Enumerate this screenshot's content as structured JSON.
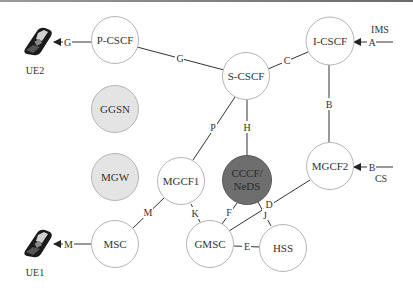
{
  "diagram": {
    "colors": {
      "line": "#333333",
      "node_stroke": "#b5b5b5",
      "node_fill": "#ffffff",
      "gray_fill": "#e4e4e4",
      "dark_fill": "#6e6e6e",
      "text": "#333333"
    },
    "nodes": {
      "pcscf": {
        "label": "P-CSCF"
      },
      "scscf": {
        "label": "S-CSCF"
      },
      "icscf": {
        "label": "I-CSCF"
      },
      "ggsn": {
        "label": "GGSN"
      },
      "mgw": {
        "label": "MGW"
      },
      "mgcf1": {
        "label": "MGCF1"
      },
      "mgcf2": {
        "label": "MGCF2"
      },
      "cccf": {
        "label_line1": "CCCF/",
        "label_line2": "NeDS"
      },
      "msc": {
        "label": "MSC"
      },
      "gmsc": {
        "label": "GMSC"
      },
      "hss": {
        "label": "HSS"
      }
    },
    "terminals": {
      "ue2": {
        "label": "UE2",
        "icon": "mobile-phone-icon"
      },
      "ue1": {
        "label": "UE1",
        "icon": "mobile-phone-icon"
      }
    },
    "domains": {
      "ims": "IMS",
      "cs": "CS"
    },
    "interfaces": {
      "ue2_pcscf": "G",
      "pcscf_scscf": "G",
      "scscf_icscf": "C",
      "ims_icscf": "A",
      "icscf_mgcf2": "B",
      "cs_mgcf2": "B",
      "scscf_mgcf1": "P",
      "scscf_cccf": "H",
      "mgcf1_msc": "M",
      "ue1_msc": "M",
      "mgcf1_gmsc": "K",
      "cccf_gmsc": "F",
      "mgcf2_gmsc": "D",
      "cccf_hss": "J",
      "gmsc_hss": "E"
    }
  }
}
